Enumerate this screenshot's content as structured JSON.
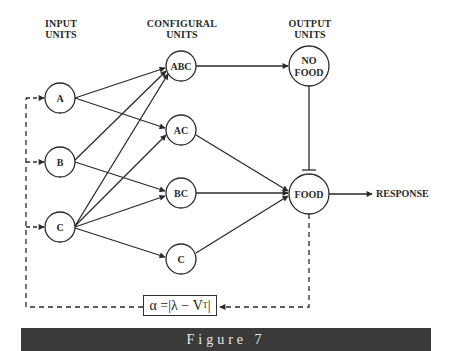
{
  "headers": {
    "input": "INPUT\nUNITS",
    "configural": "CONFIGURAL\nUNITS",
    "output": "OUTPUT\nUNITS"
  },
  "input_units": [
    {
      "id": "A",
      "label": "A"
    },
    {
      "id": "B",
      "label": "B"
    },
    {
      "id": "C",
      "label": "C"
    }
  ],
  "configural_units": [
    {
      "id": "ABC",
      "label": "ABC"
    },
    {
      "id": "AC",
      "label": "AC"
    },
    {
      "id": "BC",
      "label": "BC"
    },
    {
      "id": "Cc",
      "label": "C"
    }
  ],
  "output_units": [
    {
      "id": "NOFOOD",
      "label_line1": "NO",
      "label_line2": "FOOD"
    },
    {
      "id": "FOOD",
      "label": "FOOD"
    }
  ],
  "response_label": "RESPONSE",
  "formula": "α =|λ − V",
  "formula_subscript": "T",
  "formula_close": "|",
  "caption": "Figure 7",
  "connections": [
    {
      "from": "A",
      "to": "ABC",
      "type": "excitatory"
    },
    {
      "from": "A",
      "to": "AC",
      "type": "excitatory"
    },
    {
      "from": "B",
      "to": "ABC",
      "type": "excitatory"
    },
    {
      "from": "B",
      "to": "BC",
      "type": "excitatory"
    },
    {
      "from": "C",
      "to": "ABC",
      "type": "excitatory"
    },
    {
      "from": "C",
      "to": "AC",
      "type": "excitatory"
    },
    {
      "from": "C",
      "to": "BC",
      "type": "excitatory"
    },
    {
      "from": "C",
      "to": "Cc",
      "type": "excitatory"
    },
    {
      "from": "ABC",
      "to": "NOFOOD",
      "type": "excitatory"
    },
    {
      "from": "AC",
      "to": "FOOD",
      "type": "excitatory"
    },
    {
      "from": "BC",
      "to": "FOOD",
      "type": "excitatory"
    },
    {
      "from": "Cc",
      "to": "FOOD",
      "type": "excitatory"
    },
    {
      "from": "NOFOOD",
      "to": "FOOD",
      "type": "inhibitory"
    },
    {
      "from": "FOOD",
      "to": "RESPONSE",
      "type": "excitatory"
    },
    {
      "from": "FOOD",
      "to": "formula",
      "type": "feedback-dashed"
    },
    {
      "from": "formula",
      "to": "A,B,C",
      "type": "feedback-dashed"
    }
  ]
}
